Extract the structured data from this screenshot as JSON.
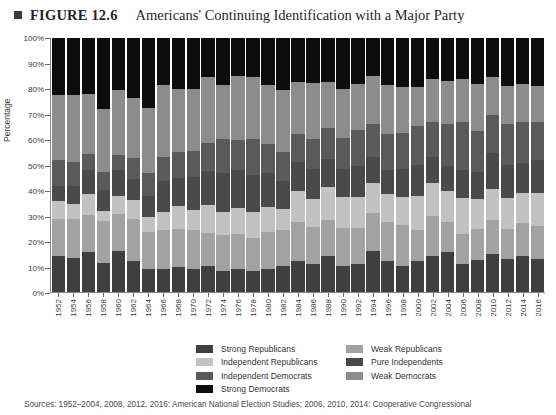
{
  "header": {
    "marker_icon": "square-bullet-icon",
    "figure_label": "FIGURE 12.6",
    "figure_title": "Americans' Continuing Identification with a Major Party"
  },
  "axes": {
    "ylabel": "Percentage",
    "yticks": [
      "0%",
      "10%",
      "20%",
      "30%",
      "40%",
      "50%",
      "60%",
      "70%",
      "80%",
      "90%",
      "100%"
    ]
  },
  "legend": {
    "items": [
      {
        "label": "Strong Republicans",
        "color": "#3f3f3f"
      },
      {
        "label": "Weak Republicans",
        "color": "#a2a2a2"
      },
      {
        "label": "Independent Republicans",
        "color": "#c2c2c2"
      },
      {
        "label": "Pure Independents",
        "color": "#4a4a4a"
      },
      {
        "label": "Independent Democrats",
        "color": "#5a5a5a"
      },
      {
        "label": "Weak Democrats",
        "color": "#8c8c8c"
      },
      {
        "label": "Strong Democrats",
        "color": "#0d0d0d"
      }
    ]
  },
  "source": "Sources: 1952–2004, 2008, 2012, 2016: American National Election Studies; 2006, 2010, 2014: Cooperative Congressional",
  "chart_data": {
    "type": "bar",
    "stacked": true,
    "title": "Americans' Continuing Identification with a Major Party",
    "xlabel": "",
    "ylabel": "Percentage",
    "ylim": [
      0,
      100
    ],
    "grid": false,
    "legend_position": "bottom",
    "categories": [
      "1952",
      "1954",
      "1956",
      "1958",
      "1960",
      "1962",
      "1964",
      "1966",
      "1968",
      "1970",
      "1972",
      "1974",
      "1976",
      "1978",
      "1980",
      "1982",
      "1984",
      "1986",
      "1988",
      "1990",
      "1992",
      "1994",
      "1996",
      "1998",
      "2000",
      "2002",
      "2004",
      "2006",
      "2008",
      "2010",
      "2012",
      "2014",
      "2016"
    ],
    "stack_order_bottom_to_top": [
      "Strong Republicans",
      "Weak Republicans",
      "Independent Republicans",
      "Pure Independents",
      "Independent Democrats",
      "Weak Democrats",
      "Strong Democrats"
    ],
    "series": [
      {
        "name": "Strong Republicans",
        "color": "#3f3f3f",
        "values": [
          14,
          13,
          15,
          11,
          16,
          12,
          9,
          9,
          10,
          9,
          10,
          8,
          9,
          8,
          9,
          10,
          12,
          11,
          14,
          10,
          11,
          16,
          12,
          10,
          12,
          14,
          16,
          11,
          13,
          15,
          13,
          14,
          13
        ]
      },
      {
        "name": "Weak Republicans",
        "color": "#a2a2a2",
        "values": [
          14,
          15,
          14,
          16,
          14,
          16,
          14,
          15,
          15,
          15,
          13,
          14,
          14,
          13,
          14,
          14,
          15,
          15,
          14,
          15,
          14,
          15,
          15,
          16,
          12,
          16,
          12,
          12,
          13,
          13,
          12,
          13,
          13
        ]
      },
      {
        "name": "Independent Republicans",
        "color": "#c2c2c2",
        "values": [
          7,
          6,
          8,
          4,
          7,
          7,
          6,
          7,
          9,
          8,
          11,
          9,
          10,
          10,
          10,
          8,
          12,
          11,
          13,
          12,
          12,
          12,
          11,
          11,
          13,
          13,
          12,
          14,
          12,
          12,
          12,
          12,
          13
        ]
      },
      {
        "name": "Pure Independents",
        "color": "#4a4a4a",
        "values": [
          6,
          7,
          9,
          8,
          10,
          8,
          8,
          12,
          11,
          13,
          13,
          15,
          15,
          14,
          13,
          11,
          11,
          12,
          11,
          11,
          12,
          10,
          9,
          11,
          12,
          10,
          10,
          11,
          11,
          14,
          13,
          12,
          13
        ]
      },
      {
        "name": "Independent Democrats",
        "color": "#5a5a5a",
        "values": [
          10,
          9,
          6,
          7,
          6,
          8,
          9,
          9,
          10,
          10,
          11,
          13,
          12,
          14,
          11,
          11,
          11,
          12,
          12,
          12,
          14,
          13,
          14,
          14,
          15,
          14,
          17,
          19,
          17,
          15,
          16,
          16,
          15
        ]
      },
      {
        "name": "Weak Democrats",
        "color": "#8c8c8c",
        "values": [
          25,
          26,
          23,
          24,
          25,
          23,
          25,
          28,
          25,
          24,
          26,
          21,
          25,
          24,
          23,
          24,
          20,
          22,
          18,
          19,
          18,
          19,
          19,
          18,
          15,
          17,
          17,
          17,
          19,
          15,
          15,
          15,
          14
        ]
      },
      {
        "name": "Strong Democrats",
        "color": "#0d0d0d",
        "values": [
          22,
          22,
          21,
          27,
          20,
          23,
          27,
          18,
          20,
          20,
          15,
          18,
          15,
          15,
          18,
          20,
          17,
          18,
          17,
          20,
          18,
          15,
          18,
          19,
          19,
          16,
          17,
          16,
          19,
          15,
          19,
          18,
          19
        ]
      }
    ]
  }
}
